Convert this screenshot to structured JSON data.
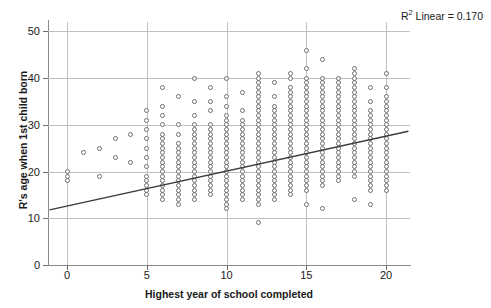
{
  "chart_data": {
    "type": "scatter",
    "title": "",
    "xlabel": "Highest year of school completed",
    "ylabel": "R's age when 1st child born",
    "xlim": [
      -1.2,
      21.5
    ],
    "ylim": [
      0,
      52
    ],
    "xticks": [
      0,
      5,
      10,
      15,
      20
    ],
    "yticks": [
      0,
      10,
      20,
      30,
      40,
      50
    ],
    "grid": true,
    "legend": "none",
    "annotation": "R² Linear = 0.170",
    "annotation_prefix": "R",
    "annotation_sup": "2",
    "annotation_suffix": " Linear = 0.170",
    "fit": {
      "type": "linear",
      "r_squared": 0.17,
      "intercept_at_x_minus1": 11.8,
      "x_start": -1.1,
      "y_start": 11.8,
      "x_end": 21.4,
      "y_end": 28.6
    },
    "marker": {
      "shape": "circle-open",
      "edge_color": "#6f6f6f",
      "face_color": "#ffffff",
      "size_px": 5
    },
    "colors": {
      "grid": "#bfbfbf",
      "axis": "#8a8a8a",
      "text": "#1a1a1a",
      "trendline": "#3c3c3c"
    },
    "points": [
      [
        0,
        19
      ],
      [
        0,
        20
      ],
      [
        0,
        18
      ],
      [
        1,
        24
      ],
      [
        2,
        25
      ],
      [
        2,
        19
      ],
      [
        3,
        27
      ],
      [
        3,
        23
      ],
      [
        4,
        28
      ],
      [
        4,
        22
      ],
      [
        5,
        19
      ],
      [
        5,
        21
      ],
      [
        5,
        23
      ],
      [
        5,
        25
      ],
      [
        5,
        27
      ],
      [
        5,
        29
      ],
      [
        5,
        31
      ],
      [
        5,
        33
      ],
      [
        5,
        18
      ],
      [
        5,
        17
      ],
      [
        5,
        16
      ],
      [
        5,
        15
      ],
      [
        6,
        38
      ],
      [
        6,
        34
      ],
      [
        6,
        32
      ],
      [
        6,
        30
      ],
      [
        6,
        28
      ],
      [
        6,
        27
      ],
      [
        6,
        26
      ],
      [
        6,
        25
      ],
      [
        6,
        24
      ],
      [
        6,
        23
      ],
      [
        6,
        22
      ],
      [
        6,
        21
      ],
      [
        6,
        20
      ],
      [
        6,
        19
      ],
      [
        6,
        18
      ],
      [
        6,
        17
      ],
      [
        6,
        16
      ],
      [
        6,
        15
      ],
      [
        6,
        14
      ],
      [
        7,
        36
      ],
      [
        7,
        30
      ],
      [
        7,
        28
      ],
      [
        7,
        26
      ],
      [
        7,
        25
      ],
      [
        7,
        24
      ],
      [
        7,
        23
      ],
      [
        7,
        22
      ],
      [
        7,
        21
      ],
      [
        7,
        20
      ],
      [
        7,
        19
      ],
      [
        7,
        18
      ],
      [
        7,
        17
      ],
      [
        7,
        16
      ],
      [
        7,
        15
      ],
      [
        7,
        14
      ],
      [
        7,
        13
      ],
      [
        8,
        40
      ],
      [
        8,
        35
      ],
      [
        8,
        32
      ],
      [
        8,
        30
      ],
      [
        8,
        29
      ],
      [
        8,
        28
      ],
      [
        8,
        27
      ],
      [
        8,
        26
      ],
      [
        8,
        25
      ],
      [
        8,
        24
      ],
      [
        8,
        23
      ],
      [
        8,
        22
      ],
      [
        8,
        21
      ],
      [
        8,
        20
      ],
      [
        8,
        19
      ],
      [
        8,
        18
      ],
      [
        8,
        17
      ],
      [
        8,
        16
      ],
      [
        8,
        15
      ],
      [
        8,
        14
      ],
      [
        9,
        38
      ],
      [
        9,
        35
      ],
      [
        9,
        33
      ],
      [
        9,
        30
      ],
      [
        9,
        29
      ],
      [
        9,
        28
      ],
      [
        9,
        27
      ],
      [
        9,
        26
      ],
      [
        9,
        25
      ],
      [
        9,
        24
      ],
      [
        9,
        23
      ],
      [
        9,
        22
      ],
      [
        9,
        21
      ],
      [
        9,
        20
      ],
      [
        9,
        19
      ],
      [
        9,
        18
      ],
      [
        9,
        17
      ],
      [
        9,
        16
      ],
      [
        9,
        15
      ],
      [
        10,
        40
      ],
      [
        10,
        36
      ],
      [
        10,
        34
      ],
      [
        10,
        32
      ],
      [
        10,
        31
      ],
      [
        10,
        30
      ],
      [
        10,
        29
      ],
      [
        10,
        28
      ],
      [
        10,
        27
      ],
      [
        10,
        26
      ],
      [
        10,
        25
      ],
      [
        10,
        24
      ],
      [
        10,
        23
      ],
      [
        10,
        22
      ],
      [
        10,
        21
      ],
      [
        10,
        20
      ],
      [
        10,
        19
      ],
      [
        10,
        18
      ],
      [
        10,
        17
      ],
      [
        10,
        16
      ],
      [
        10,
        15
      ],
      [
        10,
        14
      ],
      [
        10,
        13
      ],
      [
        10,
        12
      ],
      [
        11,
        37
      ],
      [
        11,
        33
      ],
      [
        11,
        31
      ],
      [
        11,
        30
      ],
      [
        11,
        29
      ],
      [
        11,
        28
      ],
      [
        11,
        27
      ],
      [
        11,
        26
      ],
      [
        11,
        25
      ],
      [
        11,
        24
      ],
      [
        11,
        23
      ],
      [
        11,
        22
      ],
      [
        11,
        21
      ],
      [
        11,
        20
      ],
      [
        11,
        19
      ],
      [
        11,
        18
      ],
      [
        11,
        17
      ],
      [
        11,
        16
      ],
      [
        11,
        15
      ],
      [
        11,
        14
      ],
      [
        12,
        41
      ],
      [
        12,
        40
      ],
      [
        12,
        39
      ],
      [
        12,
        38
      ],
      [
        12,
        37
      ],
      [
        12,
        36
      ],
      [
        12,
        35
      ],
      [
        12,
        34
      ],
      [
        12,
        33
      ],
      [
        12,
        32
      ],
      [
        12,
        31
      ],
      [
        12,
        30
      ],
      [
        12,
        29
      ],
      [
        12,
        28
      ],
      [
        12,
        27
      ],
      [
        12,
        26
      ],
      [
        12,
        25
      ],
      [
        12,
        24
      ],
      [
        12,
        23
      ],
      [
        12,
        22
      ],
      [
        12,
        21
      ],
      [
        12,
        20
      ],
      [
        12,
        19
      ],
      [
        12,
        18
      ],
      [
        12,
        17
      ],
      [
        12,
        16
      ],
      [
        12,
        15
      ],
      [
        12,
        14
      ],
      [
        12,
        13
      ],
      [
        12,
        9
      ],
      [
        13,
        39
      ],
      [
        13,
        36
      ],
      [
        13,
        34
      ],
      [
        13,
        33
      ],
      [
        13,
        32
      ],
      [
        13,
        31
      ],
      [
        13,
        30
      ],
      [
        13,
        29
      ],
      [
        13,
        28
      ],
      [
        13,
        27
      ],
      [
        13,
        26
      ],
      [
        13,
        25
      ],
      [
        13,
        24
      ],
      [
        13,
        23
      ],
      [
        13,
        22
      ],
      [
        13,
        21
      ],
      [
        13,
        20
      ],
      [
        13,
        19
      ],
      [
        13,
        18
      ],
      [
        13,
        17
      ],
      [
        13,
        16
      ],
      [
        13,
        15
      ],
      [
        13,
        14
      ],
      [
        14,
        41
      ],
      [
        14,
        40
      ],
      [
        14,
        38
      ],
      [
        14,
        37
      ],
      [
        14,
        36
      ],
      [
        14,
        35
      ],
      [
        14,
        34
      ],
      [
        14,
        33
      ],
      [
        14,
        32
      ],
      [
        14,
        31
      ],
      [
        14,
        30
      ],
      [
        14,
        29
      ],
      [
        14,
        28
      ],
      [
        14,
        27
      ],
      [
        14,
        26
      ],
      [
        14,
        25
      ],
      [
        14,
        24
      ],
      [
        14,
        23
      ],
      [
        14,
        22
      ],
      [
        14,
        21
      ],
      [
        14,
        20
      ],
      [
        14,
        19
      ],
      [
        14,
        18
      ],
      [
        14,
        17
      ],
      [
        14,
        16
      ],
      [
        14,
        15
      ],
      [
        15,
        46
      ],
      [
        15,
        42
      ],
      [
        15,
        40
      ],
      [
        15,
        39
      ],
      [
        15,
        38
      ],
      [
        15,
        37
      ],
      [
        15,
        36
      ],
      [
        15,
        35
      ],
      [
        15,
        34
      ],
      [
        15,
        33
      ],
      [
        15,
        32
      ],
      [
        15,
        31
      ],
      [
        15,
        30
      ],
      [
        15,
        29
      ],
      [
        15,
        28
      ],
      [
        15,
        27
      ],
      [
        15,
        26
      ],
      [
        15,
        25
      ],
      [
        15,
        24
      ],
      [
        15,
        23
      ],
      [
        15,
        22
      ],
      [
        15,
        21
      ],
      [
        15,
        20
      ],
      [
        15,
        19
      ],
      [
        15,
        18
      ],
      [
        15,
        17
      ],
      [
        15,
        16
      ],
      [
        15,
        13
      ],
      [
        16,
        44
      ],
      [
        16,
        40
      ],
      [
        16,
        39
      ],
      [
        16,
        38
      ],
      [
        16,
        37
      ],
      [
        16,
        36
      ],
      [
        16,
        35
      ],
      [
        16,
        34
      ],
      [
        16,
        33
      ],
      [
        16,
        32
      ],
      [
        16,
        31
      ],
      [
        16,
        30
      ],
      [
        16,
        29
      ],
      [
        16,
        28
      ],
      [
        16,
        27
      ],
      [
        16,
        26
      ],
      [
        16,
        25
      ],
      [
        16,
        24
      ],
      [
        16,
        23
      ],
      [
        16,
        22
      ],
      [
        16,
        21
      ],
      [
        16,
        20
      ],
      [
        16,
        19
      ],
      [
        16,
        18
      ],
      [
        16,
        17
      ],
      [
        16,
        12
      ],
      [
        17,
        40
      ],
      [
        17,
        39
      ],
      [
        17,
        38
      ],
      [
        17,
        37
      ],
      [
        17,
        36
      ],
      [
        17,
        35
      ],
      [
        17,
        34
      ],
      [
        17,
        33
      ],
      [
        17,
        32
      ],
      [
        17,
        31
      ],
      [
        17,
        30
      ],
      [
        17,
        29
      ],
      [
        17,
        28
      ],
      [
        17,
        27
      ],
      [
        17,
        26
      ],
      [
        17,
        25
      ],
      [
        17,
        24
      ],
      [
        17,
        23
      ],
      [
        17,
        22
      ],
      [
        17,
        21
      ],
      [
        17,
        20
      ],
      [
        17,
        19
      ],
      [
        17,
        18
      ],
      [
        18,
        42
      ],
      [
        18,
        41
      ],
      [
        18,
        40
      ],
      [
        18,
        39
      ],
      [
        18,
        38
      ],
      [
        18,
        37
      ],
      [
        18,
        36
      ],
      [
        18,
        35
      ],
      [
        18,
        34
      ],
      [
        18,
        33
      ],
      [
        18,
        32
      ],
      [
        18,
        31
      ],
      [
        18,
        30
      ],
      [
        18,
        29
      ],
      [
        18,
        28
      ],
      [
        18,
        27
      ],
      [
        18,
        26
      ],
      [
        18,
        25
      ],
      [
        18,
        24
      ],
      [
        18,
        23
      ],
      [
        18,
        22
      ],
      [
        18,
        21
      ],
      [
        18,
        20
      ],
      [
        18,
        19
      ],
      [
        18,
        14
      ],
      [
        19,
        38
      ],
      [
        19,
        35
      ],
      [
        19,
        33
      ],
      [
        19,
        32
      ],
      [
        19,
        31
      ],
      [
        19,
        30
      ],
      [
        19,
        29
      ],
      [
        19,
        28
      ],
      [
        19,
        27
      ],
      [
        19,
        26
      ],
      [
        19,
        25
      ],
      [
        19,
        24
      ],
      [
        19,
        23
      ],
      [
        19,
        22
      ],
      [
        19,
        21
      ],
      [
        19,
        20
      ],
      [
        19,
        19
      ],
      [
        19,
        18
      ],
      [
        19,
        17
      ],
      [
        19,
        16
      ],
      [
        19,
        13
      ],
      [
        20,
        41
      ],
      [
        20,
        38
      ],
      [
        20,
        36
      ],
      [
        20,
        35
      ],
      [
        20,
        34
      ],
      [
        20,
        33
      ],
      [
        20,
        32
      ],
      [
        20,
        31
      ],
      [
        20,
        30
      ],
      [
        20,
        29
      ],
      [
        20,
        28
      ],
      [
        20,
        27
      ],
      [
        20,
        26
      ],
      [
        20,
        25
      ],
      [
        20,
        24
      ],
      [
        20,
        23
      ],
      [
        20,
        22
      ],
      [
        20,
        21
      ],
      [
        20,
        20
      ],
      [
        20,
        19
      ],
      [
        20,
        18
      ],
      [
        20,
        17
      ],
      [
        20,
        16
      ]
    ]
  }
}
